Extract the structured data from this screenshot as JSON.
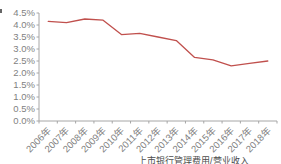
{
  "colors": {
    "background": "#ffffff",
    "line": "#c0504d",
    "axis": "#a6a6a6",
    "tick_label": "#7f7f7f",
    "caption": "#4d4d4d"
  },
  "chart_data": {
    "type": "line",
    "title": "",
    "xlabel": "",
    "ylabel": "",
    "categories": [
      "2006年",
      "2007年",
      "2008年",
      "2009年",
      "2010年",
      "2011年",
      "2012年",
      "2013年",
      "2014年",
      "2015年",
      "2016年",
      "2017年",
      "2018年"
    ],
    "values": [
      4.15,
      4.1,
      4.25,
      4.2,
      3.6,
      3.65,
      3.5,
      3.35,
      2.65,
      2.55,
      2.3,
      2.4,
      2.5
    ],
    "unit": "%",
    "y_ticks": [
      "4.5%",
      "4.0%",
      "3.5%",
      "3.0%",
      "2.5%",
      "2.0%",
      "1.5%",
      "1.0%",
      "0.5%",
      "0.0%"
    ],
    "ylim": [
      0,
      4.5
    ],
    "y_step": 0.5,
    "grid": false,
    "legend": "none"
  },
  "caption": {
    "text": "上市银行管理费用/营业收入"
  }
}
